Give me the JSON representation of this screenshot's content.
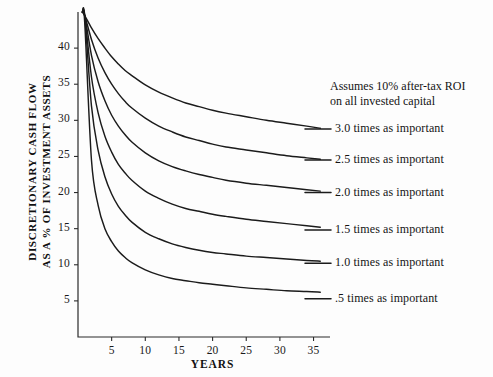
{
  "chart_data": {
    "type": "line",
    "title": "",
    "subtitle": "",
    "xlabel": "YEARS",
    "ylabel": "DISCRETIONARY CASH FLOW AS A % OF INVESTMENT ASSETS",
    "ylabel_lines": [
      "DISCRETIONARY CASH FLOW",
      "AS A % OF INVESTMENT ASSETS"
    ],
    "xlim": [
      0,
      37
    ],
    "ylim": [
      0,
      45
    ],
    "grid": false,
    "legend_position": "right-inline-labels",
    "xticks": [
      5,
      10,
      15,
      20,
      25,
      30,
      35
    ],
    "xtick_labels": [
      "5",
      "10",
      "15",
      "20",
      "25",
      "30",
      "35"
    ],
    "yticks": [
      5,
      10,
      15,
      20,
      25,
      30,
      35,
      40
    ],
    "ytick_labels": [
      "5",
      "10",
      "15",
      "20",
      "25",
      "30",
      "35",
      "40"
    ],
    "annotations": [
      "Assumes 10% after-tax ROI",
      "on all invested capital"
    ],
    "x": [
      1,
      2,
      3,
      4,
      5,
      6,
      7,
      8,
      10,
      12,
      14,
      16,
      18,
      20,
      22,
      25,
      28,
      31,
      34,
      36
    ],
    "series": [
      {
        "name": "3.0 times as important",
        "label": "3.0 times as important",
        "asymptote": 28.8,
        "values": [
          44.5,
          42.8,
          41.3,
          40.0,
          38.8,
          37.8,
          36.9,
          36.2,
          34.9,
          33.9,
          33.1,
          32.4,
          31.9,
          31.4,
          31.0,
          30.5,
          30.0,
          29.6,
          29.2,
          28.9
        ]
      },
      {
        "name": "2.5 times as important",
        "label": "2.5 times as important",
        "asymptote": 24.5,
        "values": [
          44.5,
          41.2,
          38.6,
          36.6,
          35.0,
          33.7,
          32.6,
          31.7,
          30.3,
          29.2,
          28.4,
          27.7,
          27.2,
          26.7,
          26.3,
          25.9,
          25.5,
          25.1,
          24.8,
          24.6
        ]
      },
      {
        "name": "2.0 times as important",
        "label": "2.0 times as important",
        "asymptote": 20.0,
        "values": [
          44.5,
          39.0,
          35.3,
          32.7,
          30.7,
          29.2,
          28.0,
          27.0,
          25.5,
          24.4,
          23.6,
          23.0,
          22.5,
          22.1,
          21.7,
          21.3,
          21.0,
          20.7,
          20.4,
          20.2
        ]
      },
      {
        "name": "1.5 times as important",
        "label": "1.5 times as important",
        "asymptote": 14.8,
        "values": [
          44.5,
          36.0,
          31.0,
          27.8,
          25.6,
          23.9,
          22.7,
          21.7,
          20.2,
          19.2,
          18.4,
          17.8,
          17.4,
          17.0,
          16.7,
          16.3,
          16.0,
          15.7,
          15.4,
          15.2
        ]
      },
      {
        "name": "1.0 times as important",
        "label": "1.0 times as important",
        "asymptote": 10.2,
        "values": [
          44.5,
          32.0,
          25.8,
          22.2,
          19.8,
          18.1,
          16.9,
          15.9,
          14.5,
          13.6,
          12.9,
          12.4,
          12.0,
          11.7,
          11.5,
          11.2,
          11.0,
          10.8,
          10.6,
          10.5
        ]
      },
      {
        "name": ".5 times as important",
        "label": ".5 times as important",
        "asymptote": 5.3,
        "values": [
          43.5,
          24.5,
          18.2,
          15.0,
          13.2,
          11.9,
          11.0,
          10.3,
          9.3,
          8.6,
          8.1,
          7.8,
          7.5,
          7.3,
          7.1,
          6.8,
          6.6,
          6.4,
          6.3,
          6.2
        ]
      }
    ],
    "colors": {
      "curve": "#1b1b1b",
      "axis": "#2b2b2b",
      "text": "#141414",
      "background": "#fdfdfd"
    }
  },
  "axes": {
    "x_title": "YEARS",
    "y_title_line1": "DISCRETIONARY CASH FLOW",
    "y_title_line2": "AS A % OF INVESTMENT ASSETS"
  },
  "note": {
    "line1": "Assumes 10% after-tax ROI",
    "line2": "on all invested capital"
  }
}
